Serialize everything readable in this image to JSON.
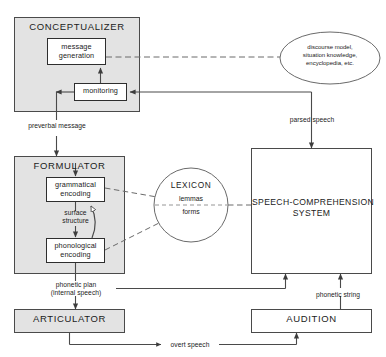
{
  "diagram": {
    "colors": {
      "module_fill": "#e3e3e3",
      "box_fill": "#ffffff",
      "stroke": "#4a4a4a",
      "text": "#1b1b1b",
      "background": "#ffffff"
    }
  },
  "modules": {
    "conceptualizer": {
      "label": "CONCEPTUALIZER",
      "shaded": true,
      "children": {
        "message_generation": {
          "line1": "message",
          "line2": "generation"
        },
        "monitoring": {
          "label": "monitoring"
        }
      }
    },
    "formulator": {
      "label": "FORMULATOR",
      "shaded": true,
      "children": {
        "grammatical_encoding": {
          "line1": "grammatical",
          "line2": "encoding"
        },
        "surface_structure": {
          "line1": "surface",
          "line2": "structure"
        },
        "phonological_encoding": {
          "line1": "phonological",
          "line2": "encoding"
        }
      }
    },
    "articulator": {
      "label": "ARTICULATOR",
      "shaded": true
    },
    "audition": {
      "label": "AUDITION",
      "shaded": false
    },
    "speech_comprehension_system": {
      "line1": "SPEECH-COMPREHENSION",
      "line2": "SYSTEM",
      "shaded": false
    }
  },
  "stores": {
    "knowledge_ellipse": {
      "line1": "discourse model,",
      "line2": "situation knowledge,",
      "line3": "encyclopedia, etc."
    },
    "lexicon": {
      "label": "LEXICON",
      "upper": "lemmas",
      "lower": "forms"
    }
  },
  "edge_labels": {
    "preverbal_message": "preverbal message",
    "parsed_speech": "parsed speech",
    "phonetic_plan_line1": "phonetic plan",
    "phonetic_plan_line2": "(internal speech)",
    "phonetic_string": "phonetic string",
    "overt_speech": "overt speech"
  }
}
